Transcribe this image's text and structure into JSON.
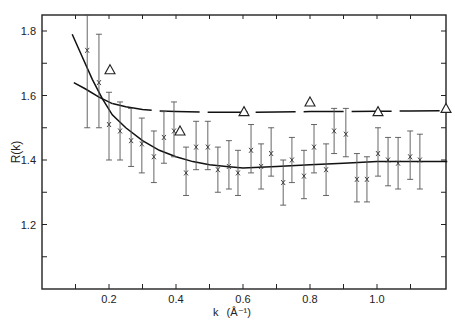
{
  "chart_data": {
    "type": "scatter",
    "title": "",
    "xlabel": "k (Å⁻¹)",
    "ylabel": "R(k)",
    "xlim": [
      0.0,
      1.2
    ],
    "ylim": [
      1.0,
      1.85
    ],
    "grid": false,
    "legend": null,
    "x_ticks": [
      0.1,
      0.2,
      0.3,
      0.4,
      0.5,
      0.6,
      0.7,
      0.8,
      0.9,
      1.0,
      1.1
    ],
    "x_tick_labels": [
      {
        "value": 0.2,
        "label": "0.2"
      },
      {
        "value": 0.4,
        "label": "0.4"
      },
      {
        "value": 0.6,
        "label": "0.6"
      },
      {
        "value": 0.8,
        "label": "0.8"
      },
      {
        "value": 1.0,
        "label": "1.0"
      }
    ],
    "y_ticks": [
      1.1,
      1.2,
      1.3,
      1.4,
      1.5,
      1.6,
      1.7,
      1.8
    ],
    "y_tick_labels": [
      {
        "value": 1.2,
        "label": "1.2"
      },
      {
        "value": 1.4,
        "label": "1.4"
      },
      {
        "value": 1.6,
        "label": "1.6"
      },
      {
        "value": 1.8,
        "label": "1.8"
      }
    ],
    "series": [
      {
        "name": "measured (x with error bars)",
        "marker": "x",
        "points": [
          {
            "k": 0.135,
            "R": 1.74,
            "lo": 1.5,
            "hi": 1.85
          },
          {
            "k": 0.17,
            "R": 1.64,
            "lo": 1.5,
            "hi": 1.79
          },
          {
            "k": 0.2,
            "R": 1.51,
            "lo": 1.4,
            "hi": 1.61
          },
          {
            "k": 0.233,
            "R": 1.49,
            "lo": 1.4,
            "hi": 1.58
          },
          {
            "k": 0.266,
            "R": 1.46,
            "lo": 1.38,
            "hi": 1.56
          },
          {
            "k": 0.298,
            "R": 1.45,
            "lo": 1.36,
            "hi": 1.53
          },
          {
            "k": 0.334,
            "R": 1.41,
            "lo": 1.33,
            "hi": 1.49
          },
          {
            "k": 0.364,
            "R": 1.47,
            "lo": 1.39,
            "hi": 1.55
          },
          {
            "k": 0.394,
            "R": 1.49,
            "lo": 1.41,
            "hi": 1.58
          },
          {
            "k": 0.43,
            "R": 1.36,
            "lo": 1.29,
            "hi": 1.44
          },
          {
            "k": 0.46,
            "R": 1.44,
            "lo": 1.37,
            "hi": 1.52
          },
          {
            "k": 0.495,
            "R": 1.44,
            "lo": 1.37,
            "hi": 1.52
          },
          {
            "k": 0.525,
            "R": 1.37,
            "lo": 1.3,
            "hi": 1.44
          },
          {
            "k": 0.558,
            "R": 1.38,
            "lo": 1.31,
            "hi": 1.46
          },
          {
            "k": 0.585,
            "R": 1.36,
            "lo": 1.29,
            "hi": 1.43
          },
          {
            "k": 0.624,
            "R": 1.43,
            "lo": 1.36,
            "hi": 1.51
          },
          {
            "k": 0.654,
            "R": 1.38,
            "lo": 1.31,
            "hi": 1.45
          },
          {
            "k": 0.684,
            "R": 1.42,
            "lo": 1.35,
            "hi": 1.5
          },
          {
            "k": 0.72,
            "R": 1.33,
            "lo": 1.26,
            "hi": 1.4
          },
          {
            "k": 0.746,
            "R": 1.4,
            "lo": 1.33,
            "hi": 1.47
          },
          {
            "k": 0.782,
            "R": 1.35,
            "lo": 1.28,
            "hi": 1.43
          },
          {
            "k": 0.812,
            "R": 1.44,
            "lo": 1.36,
            "hi": 1.51
          },
          {
            "k": 0.848,
            "R": 1.37,
            "lo": 1.29,
            "hi": 1.45
          },
          {
            "k": 0.872,
            "R": 1.49,
            "lo": 1.42,
            "hi": 1.56
          },
          {
            "k": 0.907,
            "R": 1.48,
            "lo": 1.41,
            "hi": 1.56
          },
          {
            "k": 0.94,
            "R": 1.34,
            "lo": 1.27,
            "hi": 1.42
          },
          {
            "k": 0.97,
            "R": 1.34,
            "lo": 1.27,
            "hi": 1.41
          },
          {
            "k": 1.003,
            "R": 1.42,
            "lo": 1.35,
            "hi": 1.5
          },
          {
            "k": 1.033,
            "R": 1.4,
            "lo": 1.32,
            "hi": 1.47
          },
          {
            "k": 1.063,
            "R": 1.39,
            "lo": 1.31,
            "hi": 1.47
          },
          {
            "k": 1.099,
            "R": 1.41,
            "lo": 1.34,
            "hi": 1.49
          },
          {
            "k": 1.128,
            "R": 1.4,
            "lo": 1.31,
            "hi": 1.48
          }
        ]
      },
      {
        "name": "reference (triangles)",
        "marker": "triangle",
        "points": [
          {
            "k": 0.203,
            "R": 1.68
          },
          {
            "k": 0.412,
            "R": 1.49
          },
          {
            "k": 0.603,
            "R": 1.55
          },
          {
            "k": 0.8,
            "R": 1.58
          },
          {
            "k": 1.003,
            "R": 1.55
          },
          {
            "k": 1.206,
            "R": 1.56
          }
        ]
      },
      {
        "name": "solid fit curve (steep)",
        "style": "solid",
        "x": [
          0.09,
          0.12,
          0.15,
          0.18,
          0.21,
          0.25,
          0.3,
          0.35,
          0.4,
          0.45,
          0.5,
          0.55,
          0.6,
          0.7,
          0.8,
          0.9,
          1.0,
          1.1,
          1.21
        ],
        "y": [
          1.79,
          1.72,
          1.65,
          1.59,
          1.54,
          1.5,
          1.46,
          1.43,
          1.41,
          1.395,
          1.385,
          1.38,
          1.375,
          1.38,
          1.385,
          1.39,
          1.395,
          1.395,
          1.395
        ]
      },
      {
        "name": "solid fit curve (shallow)",
        "style": "solid",
        "x": [
          0.095,
          0.13,
          0.17,
          0.21
        ],
        "y": [
          1.64,
          1.62,
          1.595,
          1.575
        ]
      },
      {
        "name": "dashed fit curve",
        "style": "dashed",
        "x": [
          0.21,
          0.25,
          0.3,
          0.35,
          0.4,
          0.5,
          0.6,
          0.7,
          0.8,
          0.9,
          1.0,
          1.1,
          1.21
        ],
        "y": [
          1.575,
          1.565,
          1.557,
          1.552,
          1.55,
          1.548,
          1.548,
          1.549,
          1.55,
          1.55,
          1.551,
          1.552,
          1.553
        ]
      }
    ]
  },
  "axes": {
    "x_label_main": "k",
    "x_label_unit": "(Å⁻¹)",
    "y_label": "R(k)"
  }
}
